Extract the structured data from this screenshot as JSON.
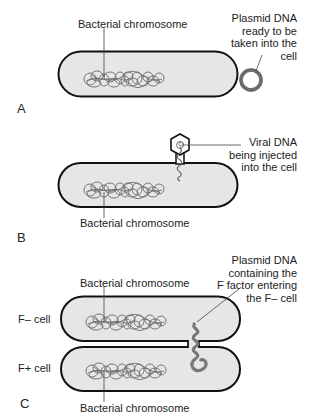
{
  "figure": {
    "panels": [
      {
        "id": "A",
        "letter": "A",
        "chromosome_label": "Bacterial chromosome",
        "annotation": [
          "Plasmid DNA",
          "ready to be",
          "taken into the",
          "cell"
        ]
      },
      {
        "id": "B",
        "letter": "B",
        "chromosome_label": "Bacterial chromosome",
        "annotation": [
          "Viral DNA",
          "being injected",
          "into the cell"
        ]
      },
      {
        "id": "C",
        "letter": "C",
        "top_chromosome_label": "Bacterial chromosome",
        "bottom_chromosome_label": "Bacterial chromosome",
        "f_minus_label": "F–  cell",
        "f_plus_label": "F+  cell",
        "annotation": [
          "Plasmid DNA",
          "containing the",
          "F factor entering",
          "the F– cell"
        ]
      }
    ],
    "colors": {
      "cell_fill": "#e6e6e6",
      "cell_stroke": "#111111",
      "dna": "#666666",
      "text": "#222222"
    }
  }
}
